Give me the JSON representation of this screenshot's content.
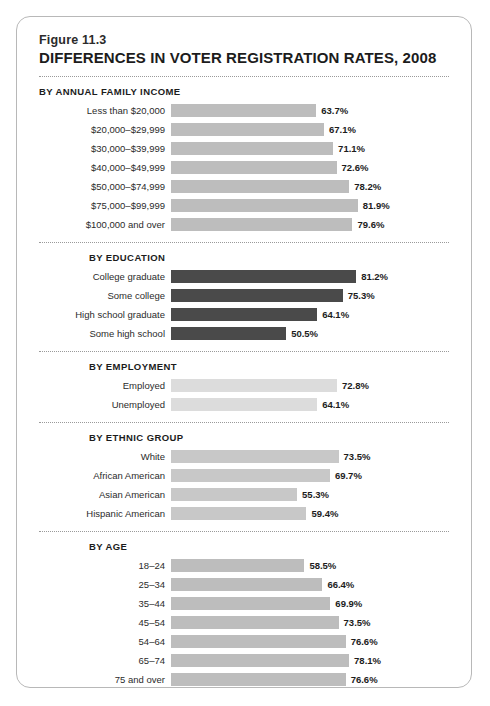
{
  "figure": {
    "number": "Figure 11.3",
    "title": "DIFFERENCES IN VOTER REGISTRATION RATES, 2008"
  },
  "colors": {
    "income_bar": "#bdbdbd",
    "education_bar": "#4a4a4a",
    "employment_bar": "#dcdcdc",
    "ethnic_bar": "#c8c8c8",
    "age_bar": "#bdbdbd",
    "card_border": "#b8b8b8",
    "text": "#1c1c1c"
  },
  "chart_data": {
    "type": "bar",
    "title": "DIFFERENCES IN VOTER REGISTRATION RATES, 2008",
    "subtitle": "Figure 11.3",
    "orientation": "horizontal",
    "xlabel": "",
    "ylabel": "",
    "xlim": [
      0,
      100
    ],
    "grid": false,
    "legend": "none",
    "value_suffix": "%",
    "groups": [
      {
        "header": "BY ANNUAL FAMILY INCOME",
        "bar_color": "#bdbdbd",
        "header_indented": false,
        "categories": [
          "Less than $20,000",
          "$20,000–$29,999",
          "$30,000–$39,999",
          "$40,000–$49,999",
          "$50,000–$74,999",
          "$75,000–$99,999",
          "$100,000 and over"
        ],
        "values": [
          63.7,
          67.1,
          71.1,
          72.6,
          78.2,
          81.9,
          79.6
        ],
        "labels": [
          "63.7%",
          "67.1%",
          "71.1%",
          "72.6%",
          "78.2%",
          "81.9%",
          "79.6%"
        ]
      },
      {
        "header": "BY EDUCATION",
        "bar_color": "#4a4a4a",
        "header_indented": true,
        "categories": [
          "College graduate",
          "Some college",
          "High school graduate",
          "Some high school"
        ],
        "values": [
          81.2,
          75.3,
          64.1,
          50.5
        ],
        "labels": [
          "81.2%",
          "75.3%",
          "64.1%",
          "50.5%"
        ]
      },
      {
        "header": "BY EMPLOYMENT",
        "bar_color": "#dcdcdc",
        "header_indented": true,
        "categories": [
          "Employed",
          "Unemployed"
        ],
        "values": [
          72.8,
          64.1
        ],
        "labels": [
          "72.8%",
          "64.1%"
        ]
      },
      {
        "header": "BY ETHNIC GROUP",
        "bar_color": "#c8c8c8",
        "header_indented": true,
        "categories": [
          "White",
          "African American",
          "Asian American",
          "Hispanic American"
        ],
        "values": [
          73.5,
          69.7,
          55.3,
          59.4
        ],
        "labels": [
          "73.5%",
          "69.7%",
          "55.3%",
          "59.4%"
        ]
      },
      {
        "header": "BY AGE",
        "bar_color": "#bdbdbd",
        "header_indented": true,
        "categories": [
          "18–24",
          "25–34",
          "35–44",
          "45–54",
          "54–64",
          "65–74",
          "75 and over"
        ],
        "values": [
          58.5,
          66.4,
          69.9,
          73.5,
          76.6,
          78.1,
          76.6
        ],
        "labels": [
          "58.5%",
          "66.4%",
          "69.9%",
          "73.5%",
          "76.6%",
          "78.1%",
          "76.6%"
        ]
      }
    ]
  }
}
